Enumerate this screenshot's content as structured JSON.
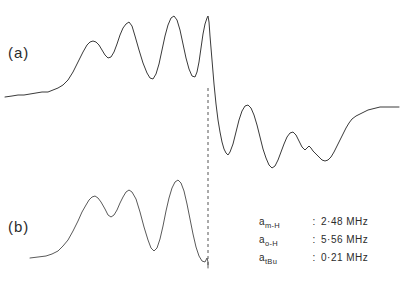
{
  "figure": {
    "type": "esr-spectrum",
    "background_color": "#ffffff",
    "trace_color": "#3a3a3a",
    "guide_color": "#555555"
  },
  "labels": {
    "trace_a": "(a)",
    "trace_b": "(b)"
  },
  "parameters": [
    {
      "symbol": "a",
      "subscript": "m-H",
      "equals": ":",
      "value": "2·48 MHz"
    },
    {
      "symbol": "a",
      "subscript": "o-H",
      "equals": ":",
      "value": "5·56 MHz"
    },
    {
      "symbol": "a",
      "subscript": "tBu",
      "equals": ":",
      "value": "0·21 MHz"
    }
  ],
  "chart_data": {
    "type": "line",
    "title": "",
    "subtitle": "",
    "xlabel": "",
    "ylabel": "",
    "grid": false,
    "legend_position": "none",
    "axis_visible": false,
    "xlim": [
      0,
      401
    ],
    "ylim": [
      283,
      0
    ],
    "annotations": [
      {
        "name": "trace-a-label",
        "text": "(a)",
        "x": 8,
        "y": 56
      },
      {
        "name": "trace-b-label",
        "text": "(b)",
        "x": 8,
        "y": 230
      },
      {
        "name": "hyperfine-m-H",
        "text": "a m-H : 2·48 MHz",
        "x": 262,
        "y": 230
      },
      {
        "name": "hyperfine-o-H",
        "text": "a o-H : 5·56 MHz",
        "x": 262,
        "y": 248
      },
      {
        "name": "hyperfine-tBu",
        "text": "a tBu : 0·21 MHz",
        "x": 262,
        "y": 266
      }
    ],
    "guide_line": {
      "name": "center-field-marker",
      "orientation": "vertical",
      "x": 208,
      "y_start": 88,
      "y_end": 268,
      "style": "dashed"
    },
    "series": [
      {
        "name": "(a) experimental spectrum",
        "style": "solid",
        "points": [
          [
            5,
            97
          ],
          [
            12,
            96
          ],
          [
            18,
            95
          ],
          [
            24,
            95
          ],
          [
            30,
            94
          ],
          [
            36,
            93
          ],
          [
            42,
            92
          ],
          [
            48,
            92
          ],
          [
            53,
            90
          ],
          [
            58,
            88
          ],
          [
            63,
            85
          ],
          [
            68,
            80
          ],
          [
            73,
            72
          ],
          [
            78,
            62
          ],
          [
            83,
            52
          ],
          [
            87,
            45
          ],
          [
            90,
            42
          ],
          [
            93,
            41
          ],
          [
            96,
            42
          ],
          [
            99,
            45
          ],
          [
            102,
            50
          ],
          [
            105,
            55
          ],
          [
            108,
            58
          ],
          [
            111,
            57
          ],
          [
            114,
            52
          ],
          [
            117,
            44
          ],
          [
            120,
            35
          ],
          [
            123,
            28
          ],
          [
            126,
            24
          ],
          [
            129,
            22
          ],
          [
            132,
            26
          ],
          [
            135,
            36
          ],
          [
            139,
            50
          ],
          [
            143,
            63
          ],
          [
            147,
            73
          ],
          [
            150,
            78
          ],
          [
            153,
            79
          ],
          [
            156,
            74
          ],
          [
            159,
            64
          ],
          [
            162,
            50
          ],
          [
            165,
            36
          ],
          [
            168,
            25
          ],
          [
            171,
            18
          ],
          [
            174,
            16
          ],
          [
            177,
            20
          ],
          [
            180,
            30
          ],
          [
            183,
            44
          ],
          [
            186,
            58
          ],
          [
            189,
            69
          ],
          [
            192,
            76
          ],
          [
            195,
            77
          ],
          [
            197,
            72
          ],
          [
            199,
            62
          ],
          [
            201,
            48
          ],
          [
            203,
            34
          ],
          [
            205,
            24
          ],
          [
            207,
            18
          ],
          [
            208,
            16
          ],
          [
            209,
            22
          ],
          [
            210,
            36
          ],
          [
            212,
            60
          ],
          [
            214,
            84
          ],
          [
            216,
            104
          ],
          [
            218,
            120
          ],
          [
            220,
            132
          ],
          [
            222,
            142
          ],
          [
            224,
            149
          ],
          [
            226,
            153
          ],
          [
            228,
            155
          ],
          [
            230,
            152
          ],
          [
            233,
            144
          ],
          [
            236,
            132
          ],
          [
            239,
            120
          ],
          [
            242,
            111
          ],
          [
            245,
            106
          ],
          [
            248,
            105
          ],
          [
            251,
            108
          ],
          [
            254,
            115
          ],
          [
            257,
            125
          ],
          [
            260,
            137
          ],
          [
            263,
            149
          ],
          [
            266,
            158
          ],
          [
            269,
            165
          ],
          [
            272,
            168
          ],
          [
            275,
            166
          ],
          [
            278,
            160
          ],
          [
            281,
            152
          ],
          [
            284,
            144
          ],
          [
            287,
            137
          ],
          [
            290,
            133
          ],
          [
            293,
            132
          ],
          [
            296,
            135
          ],
          [
            299,
            141
          ],
          [
            302,
            147
          ],
          [
            305,
            150
          ],
          [
            307,
            148
          ],
          [
            309,
            146
          ],
          [
            311,
            148
          ],
          [
            313,
            151
          ],
          [
            316,
            154
          ],
          [
            319,
            157
          ],
          [
            322,
            160
          ],
          [
            325,
            161
          ],
          [
            328,
            160
          ],
          [
            331,
            157
          ],
          [
            334,
            152
          ],
          [
            337,
            146
          ],
          [
            340,
            140
          ],
          [
            343,
            134
          ],
          [
            346,
            128
          ],
          [
            349,
            123
          ],
          [
            352,
            119
          ],
          [
            356,
            116
          ],
          [
            360,
            114
          ],
          [
            364,
            112
          ],
          [
            368,
            110
          ],
          [
            372,
            109
          ],
          [
            376,
            108
          ],
          [
            380,
            107
          ],
          [
            385,
            107
          ],
          [
            390,
            107
          ],
          [
            395,
            107
          ],
          [
            399,
            107
          ]
        ]
      },
      {
        "name": "(b) simulated spectrum",
        "style": "solid",
        "points": [
          [
            30,
            258
          ],
          [
            38,
            257
          ],
          [
            46,
            256
          ],
          [
            52,
            254
          ],
          [
            58,
            251
          ],
          [
            63,
            246
          ],
          [
            68,
            240
          ],
          [
            73,
            231
          ],
          [
            78,
            221
          ],
          [
            82,
            212
          ],
          [
            86,
            205
          ],
          [
            89,
            200
          ],
          [
            92,
            197
          ],
          [
            95,
            196
          ],
          [
            98,
            198
          ],
          [
            101,
            202
          ],
          [
            105,
            209
          ],
          [
            108,
            215
          ],
          [
            111,
            217
          ],
          [
            114,
            215
          ],
          [
            117,
            210
          ],
          [
            120,
            203
          ],
          [
            123,
            197
          ],
          [
            126,
            192
          ],
          [
            129,
            190
          ],
          [
            132,
            192
          ],
          [
            136,
            199
          ],
          [
            140,
            212
          ],
          [
            144,
            227
          ],
          [
            148,
            240
          ],
          [
            151,
            248
          ],
          [
            154,
            251
          ],
          [
            157,
            248
          ],
          [
            160,
            239
          ],
          [
            163,
            226
          ],
          [
            166,
            211
          ],
          [
            169,
            198
          ],
          [
            172,
            188
          ],
          [
            175,
            182
          ],
          [
            178,
            180
          ],
          [
            181,
            183
          ],
          [
            184,
            191
          ],
          [
            187,
            204
          ],
          [
            190,
            219
          ],
          [
            193,
            234
          ],
          [
            196,
            247
          ],
          [
            199,
            256
          ],
          [
            202,
            261
          ],
          [
            205,
            262
          ],
          [
            206,
            260
          ],
          [
            207,
            258
          ],
          [
            208,
            262
          ],
          [
            208,
            268
          ]
        ]
      }
    ]
  }
}
